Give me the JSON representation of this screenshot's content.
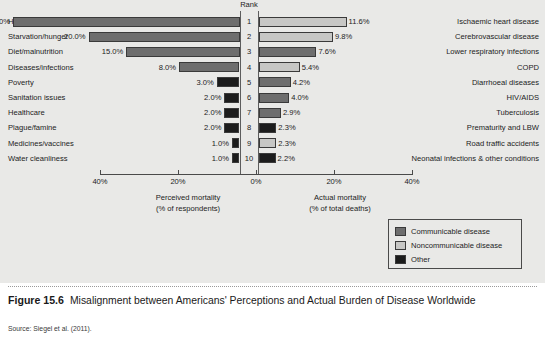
{
  "figure": {
    "number": "Figure 15.6",
    "title": "Misalignment between Americans' Perceptions and Actual Burden of Disease Worldwide",
    "source": "Source: Siegel et al. (2011)."
  },
  "rank_header": "Rank",
  "axis": {
    "ticks": [
      "40%",
      "20%",
      "0%",
      "20%",
      "40%"
    ],
    "left_title_line1": "Perceived mortality",
    "left_title_line2": "(% of respondents)",
    "right_title_line1": "Actual mortality",
    "right_title_line2": "(% of total deaths)"
  },
  "legend": {
    "items": [
      {
        "label": "Communicable disease",
        "color": "#6e6e6e"
      },
      {
        "label": "Noncommunicable disease",
        "color": "#c7c7c5"
      },
      {
        "label": "Other",
        "color": "#1c1c1c"
      }
    ]
  },
  "colors": {
    "communicable": "#6e6e6e",
    "noncommunicable": "#c7c7c5",
    "other": "#1c1c1c",
    "background": "#e9e9e7",
    "axis": "#4a4a4a"
  },
  "chart_data": {
    "type": "bar",
    "title": "Misalignment between Americans' Perceptions and Actual Burden of Disease Worldwide",
    "xlabel": "Percent",
    "ylabel": "Rank",
    "xlim": [
      0,
      40
    ],
    "grid": false,
    "legend_position": "bottom-right",
    "ranks": [
      1,
      2,
      3,
      4,
      5,
      6,
      7,
      8,
      9,
      10
    ],
    "left_panel": {
      "name": "Perceived mortality (% of respondents)",
      "direction": "left",
      "categories": [
        "HIV/AIDS",
        "Starvation/hunger",
        "Diet/malnutrition",
        "Diseases/infections",
        "Poverty",
        "Sanitation issues",
        "Healthcare",
        "Plague/famine",
        "Medicines/vaccines",
        "Water cleanliness"
      ],
      "values": [
        30.0,
        20.0,
        15.0,
        8.0,
        3.0,
        2.0,
        2.0,
        2.0,
        1.0,
        1.0
      ],
      "value_labels": [
        "30.0%",
        "20.0%",
        "15.0%",
        "8.0%",
        "3.0%",
        "2.0%",
        "2.0%",
        "2.0%",
        "1.0%",
        "1.0%"
      ],
      "categories_class": [
        "communicable",
        "communicable",
        "communicable",
        "communicable",
        "other",
        "other",
        "other",
        "other",
        "other",
        "other"
      ]
    },
    "right_panel": {
      "name": "Actual mortality (% of total deaths)",
      "direction": "right",
      "categories": [
        "Ischaemic heart disease",
        "Cerebrovascular disease",
        "Lower respiratory infections",
        "COPD",
        "Diarrhoeal diseases",
        "HIV/AIDS",
        "Tuberculosis",
        "Prematurity and LBW",
        "Road traffic accidents",
        "Neonatal infections & other conditions"
      ],
      "values": [
        11.6,
        9.8,
        7.6,
        5.4,
        4.2,
        4.0,
        2.9,
        2.3,
        2.3,
        2.2
      ],
      "value_labels": [
        "11.6%",
        "9.8%",
        "7.6%",
        "5.4%",
        "4.2%",
        "4.0%",
        "2.9%",
        "2.3%",
        "2.3%",
        "2.2%"
      ],
      "categories_class": [
        "noncommunicable",
        "noncommunicable",
        "communicable",
        "noncommunicable",
        "communicable",
        "communicable",
        "communicable",
        "other",
        "noncommunicable",
        "other"
      ]
    }
  }
}
